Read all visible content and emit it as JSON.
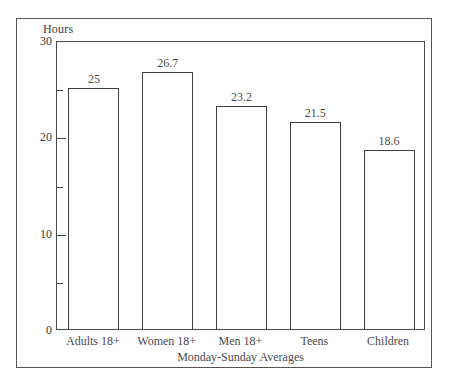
{
  "chart_data": {
    "type": "bar",
    "title": "",
    "categories": [
      "Adults 18+",
      "Women 18+",
      "Men 18+",
      "Teens",
      "Children"
    ],
    "values": [
      25,
      26.7,
      23.2,
      21.5,
      18.6
    ],
    "value_labels": [
      "25",
      "26.7",
      "23.2",
      "21.5",
      "18.6"
    ],
    "xlabel": "Monday-Sunday Averages",
    "ylabel": "Hours",
    "ylim": [
      0,
      30
    ],
    "y_major_ticks": [
      0,
      10,
      20,
      30
    ],
    "y_major_tick_labels": [
      "0",
      "10",
      "20",
      "30"
    ],
    "y_minor_ticks": [
      5,
      15,
      25
    ],
    "grid": false,
    "legend": false,
    "bar_fill": "#ffffff",
    "bar_edge": "#3d3d3d",
    "axis_color": "#4a4a4a",
    "background": "#ffffff"
  }
}
